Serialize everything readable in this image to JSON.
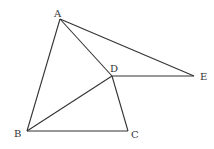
{
  "figure": {
    "title": "",
    "points": {
      "A": {
        "label": "A",
        "x": 60,
        "y": 19,
        "lx": 54,
        "ly": 17
      },
      "B": {
        "label": "B",
        "x": 27,
        "y": 131,
        "lx": 14,
        "ly": 137
      },
      "C": {
        "label": "C",
        "x": 128,
        "y": 131,
        "lx": 131,
        "ly": 138
      },
      "D": {
        "label": "D",
        "x": 112,
        "y": 76,
        "lx": 110,
        "ly": 72
      },
      "E": {
        "label": "E",
        "x": 194,
        "y": 76,
        "lx": 200,
        "ly": 80
      }
    },
    "segments": [
      [
        "A",
        "B"
      ],
      [
        "A",
        "D"
      ],
      [
        "A",
        "E"
      ],
      [
        "D",
        "E"
      ],
      [
        "D",
        "B"
      ],
      [
        "D",
        "C"
      ],
      [
        "B",
        "C"
      ]
    ],
    "stroke_color": "#333333",
    "label_color": "#333333"
  }
}
